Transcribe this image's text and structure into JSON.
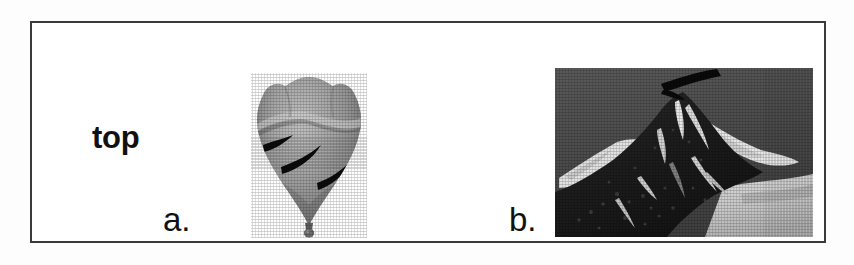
{
  "figure": {
    "kind": "two-panel scanned grayscale figure with border",
    "frame": {
      "border_color": "#3a3a3c",
      "background_color": "#ffffff"
    },
    "labels": {
      "orientation_label": "top",
      "panel_a_label": "a.",
      "panel_b_label": "b."
    },
    "panels": [
      {
        "id": "a",
        "label": "a.",
        "icon_name": "balloon-photograph",
        "description": "grayscale halftone photograph of an inflated balloon-like object with pointed lower tip and small nozzle",
        "streak_count": 3,
        "tone_light": "#b9b9b9",
        "tone_mid": "#8d8d8d",
        "tone_dark": "#5d5d5d",
        "streak_color": "#0c0c0c"
      },
      {
        "id": "b",
        "label": "b.",
        "icon_name": "mountain-summit-photograph",
        "description": "grayscale halftone photograph of a rocky snow-covered mountain summit against a dark sky with a dark streak above the peak",
        "sky_tone": "#4f4f4f",
        "rock_tone": "#1d1d1d",
        "snow_tone": "#ececec",
        "snowfield_tone": "#c9c9c9"
      }
    ]
  }
}
